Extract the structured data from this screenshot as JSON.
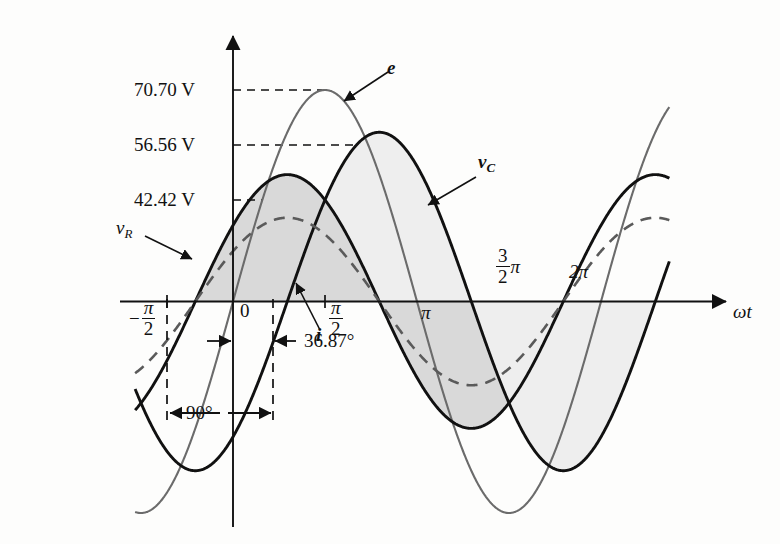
{
  "figure": {
    "type": "waveform-plot",
    "axis_x_label": "ωt",
    "background": "#fdfdfc",
    "ink": "#111111"
  },
  "y_axis": {
    "ticks": [
      {
        "value": 70.7,
        "label": "70.70 V",
        "y_px": 90
      },
      {
        "value": 56.56,
        "label": "56.56 V",
        "y_px": 145
      },
      {
        "value": 42.42,
        "label": "42.42 V",
        "y_px": 200
      }
    ]
  },
  "x_axis": {
    "ticks": [
      {
        "label_num": "π",
        "label_den": "2",
        "sign": "−",
        "kind": "fraction",
        "name": "minus-pi-over-2"
      },
      {
        "label": "0",
        "kind": "plain",
        "name": "zero"
      },
      {
        "label_num": "π",
        "label_den": "2",
        "sign": "",
        "kind": "fraction",
        "name": "pi-over-2"
      },
      {
        "label": "π",
        "kind": "plain",
        "name": "pi"
      },
      {
        "label_num": "3",
        "label_den": "2",
        "suffix": "π",
        "kind": "fraction",
        "name": "three-pi-over-2"
      },
      {
        "label": "2π",
        "kind": "plain",
        "name": "two-pi"
      }
    ]
  },
  "curves": [
    {
      "name": "e",
      "label": "e",
      "style": "solid",
      "color": "#6b6b6b",
      "amplitude_v": 70.7,
      "phase_deg": 0
    },
    {
      "name": "vC",
      "label": "v",
      "sub": "C",
      "style": "solid",
      "color": "#111111",
      "amplitude_v": 56.56,
      "phase_deg": -53.13
    },
    {
      "name": "vR",
      "label": "v",
      "sub": "R",
      "style": "solid",
      "color": "#111111",
      "amplitude_v": 42.42,
      "phase_deg": 36.87
    },
    {
      "name": "i",
      "label": "i",
      "style": "dashed",
      "color": "#5a5a5a",
      "amplitude_v": 28.0,
      "phase_deg": 36.87
    }
  ],
  "annotations": {
    "angle_90": "90°",
    "angle_3687": "36.87°",
    "vr_label": "v",
    "vr_sub": "R",
    "vc_label": "v",
    "vc_sub": "C",
    "e_label": "e",
    "i_label": "i"
  },
  "chart_data": {
    "type": "line",
    "title": "",
    "xlabel": "ωt",
    "ylabel": "",
    "xlim": [
      -1.5707963,
      7.33
    ],
    "ylim": [
      -80,
      80
    ],
    "grid": false,
    "legend": "inline-annotations",
    "x_tick_labels": [
      "−π/2",
      "0",
      "π/2",
      "π",
      "3π/2",
      "2π"
    ],
    "x_tick_values": [
      -1.5708,
      0,
      1.5708,
      3.1416,
      4.7124,
      6.2832
    ],
    "y_tick_labels": [
      "42.42 V",
      "56.56 V",
      "70.70 V"
    ],
    "y_tick_values": [
      42.42,
      56.56,
      70.7
    ],
    "series": [
      {
        "name": "e",
        "amplitude": 70.7,
        "phase_deg": 0,
        "style": "solid",
        "color": "#6b6b6b",
        "annotation": "e",
        "peak_x": 1.5708,
        "peak_y": 70.7
      },
      {
        "name": "v_C",
        "amplitude": 56.56,
        "phase_deg": -53.13,
        "style": "solid",
        "color": "#111111",
        "annotation": "v_C",
        "peak_x": 2.4983,
        "peak_y": 56.56
      },
      {
        "name": "v_R",
        "amplitude": 42.42,
        "phase_deg": 36.87,
        "style": "solid",
        "color": "#111111",
        "annotation": "v_R",
        "peak_x": 0.9272,
        "peak_y": 42.42
      },
      {
        "name": "i",
        "amplitude": 28.0,
        "phase_deg": 36.87,
        "style": "dashed",
        "color": "#5a5a5a",
        "annotation": "i",
        "peak_x": 0.9272,
        "peak_y": 28.0
      }
    ],
    "annotations": [
      {
        "text": "90°",
        "type": "span-measure",
        "from_x": -1.5708,
        "to_x": 0.6435
      },
      {
        "text": "36.87°",
        "type": "span-measure",
        "from_x": 0,
        "to_x": 0.6435
      }
    ]
  }
}
